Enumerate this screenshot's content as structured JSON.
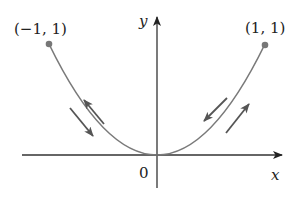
{
  "diagram": {
    "type": "parametric-curve-path",
    "curve": "y = x^2 for -1 <= x <= 1",
    "colors": {
      "curve": "#7a7a7a",
      "axes": "#333333",
      "arrows": "#666666",
      "points": "#777777",
      "text": "#222222"
    },
    "axes": {
      "x_label": "x",
      "y_label": "y",
      "origin_label": "0"
    },
    "points": [
      {
        "label": "(−1, 1)",
        "x": -1,
        "y": 1
      },
      {
        "label": "(1, 1)",
        "x": 1,
        "y": 1
      }
    ],
    "direction_arrows": [
      {
        "side": "left",
        "direction": "up-left"
      },
      {
        "side": "left",
        "direction": "down-right"
      },
      {
        "side": "right",
        "direction": "down-left"
      },
      {
        "side": "right",
        "direction": "up-right"
      }
    ]
  }
}
